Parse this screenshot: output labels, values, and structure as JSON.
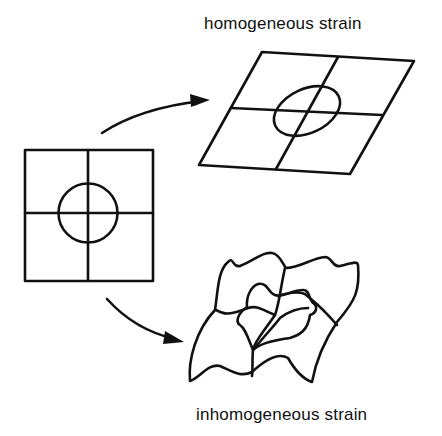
{
  "diagram": {
    "labels": {
      "homogeneous": "homogeneous strain",
      "inhomogeneous": "inhomogeneous strain"
    },
    "elements": {
      "original": "undeformed square grid with inscribed circle",
      "homogeneous": "parallelogram grid with inscribed ellipse",
      "inhomogeneous": "irregularly distorted grid with distorted circle"
    },
    "arrows": [
      {
        "from": "original",
        "to": "homogeneous"
      },
      {
        "from": "original",
        "to": "inhomogeneous"
      }
    ],
    "colors": {
      "line": "#111111",
      "background": "#ffffff"
    }
  }
}
